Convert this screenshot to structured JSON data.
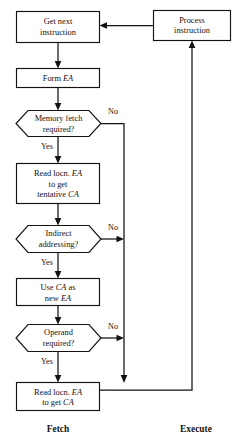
{
  "diagram": {
    "background_color": "#ffffff",
    "line_color": "#15110f",
    "nodes": {
      "get_next_instruction": {
        "type": "process",
        "lines": [
          "Get next",
          "instruction"
        ]
      },
      "process_instruction": {
        "type": "process",
        "lines": [
          "Process",
          "instruction"
        ]
      },
      "form_ea": {
        "type": "process",
        "line_parts": [
          [
            {
              "t": "Form ",
              "style": "normal"
            },
            {
              "t": "EA",
              "style": "italic"
            }
          ]
        ]
      },
      "memory_fetch_required": {
        "type": "decision",
        "lines": [
          "Memory fetch",
          "required?"
        ]
      },
      "read_locn_tentative": {
        "type": "process",
        "line_parts": [
          [
            {
              "t": "Read locn. ",
              "style": "normal"
            },
            {
              "t": "EA",
              "style": "italic"
            }
          ],
          [
            {
              "t": "to get",
              "style": "normal"
            }
          ],
          [
            {
              "t": "tentative ",
              "style": "normal"
            },
            {
              "t": "CA",
              "style": "italic"
            }
          ]
        ]
      },
      "indirect_addressing": {
        "type": "decision",
        "lines": [
          "Indirect",
          "addressing?"
        ]
      },
      "use_ca_as_new_ea": {
        "type": "process",
        "line_parts": [
          [
            {
              "t": "Use ",
              "style": "normal"
            },
            {
              "t": "CA",
              "style": "italic"
            },
            {
              "t": " as",
              "style": "normal"
            }
          ],
          [
            {
              "t": "new ",
              "style": "normal"
            },
            {
              "t": "EA",
              "style": "italic"
            }
          ]
        ]
      },
      "operand_required": {
        "type": "decision",
        "lines": [
          "Operand",
          "required?"
        ]
      },
      "read_locn_get_ca": {
        "type": "process",
        "line_parts": [
          [
            {
              "t": "Read locn. ",
              "style": "normal"
            },
            {
              "t": "EA",
              "style": "italic"
            }
          ],
          [
            {
              "t": "to get ",
              "style": "normal"
            },
            {
              "t": "CA",
              "style": "italic"
            }
          ]
        ]
      }
    },
    "branch_labels": {
      "memory_fetch_no": "No",
      "memory_fetch_yes": "Yes",
      "indirect_no": "No",
      "indirect_yes": "Yes",
      "operand_no": "No",
      "operand_yes": "Yes"
    },
    "phase_labels": {
      "fetch": "Fetch",
      "execute": "Execute"
    }
  }
}
